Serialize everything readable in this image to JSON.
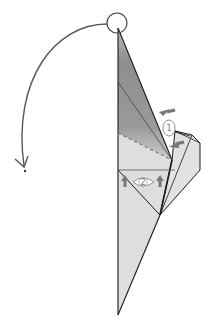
{
  "diagram": {
    "colors": {
      "background": "#ffffff",
      "paper": "#dddddd",
      "paper_dark": "#8f8f8f",
      "line": "#1a1a1a",
      "arrow": "#555555",
      "dashed": "#777777",
      "symbol": "#888888"
    },
    "steps": [
      {
        "id": "1",
        "label": "1",
        "symbol": "eye-view",
        "note": "view from side with two push arrows"
      },
      {
        "id": "2",
        "label": "2",
        "symbol": "eye-view",
        "note": "view from below with two up arrows"
      }
    ],
    "fold_arrow": {
      "direction": "rotate-down-left",
      "origin": "top-point"
    }
  }
}
